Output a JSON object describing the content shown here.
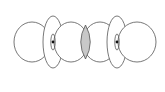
{
  "diagram": {
    "type": "orbital-overlap",
    "colors": {
      "stroke": "#555555",
      "fill": "#ffffff",
      "overlap": "#c8c8c8",
      "nucleus": "#111111"
    },
    "atoms": [
      {
        "id": "atom-left",
        "nucleus": {
          "x": 53,
          "y": 42
        }
      },
      {
        "id": "atom-right",
        "nucleus": {
          "x": 117,
          "y": 42
        }
      }
    ]
  }
}
